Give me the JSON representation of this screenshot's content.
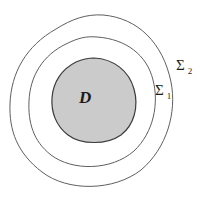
{
  "diagram": {
    "colors": {
      "background": "#ffffff",
      "curve_stroke": "#5f5f5f",
      "region_fill": "#cbcbcb",
      "region_outline": "#3c3c3c",
      "label_color": "#1b1b1b"
    },
    "labels": {
      "region": "D",
      "surface_inner": {
        "symbol": "Σ",
        "subscript": "1"
      },
      "surface_outer": {
        "symbol": "Σ",
        "subscript": "2"
      }
    }
  }
}
